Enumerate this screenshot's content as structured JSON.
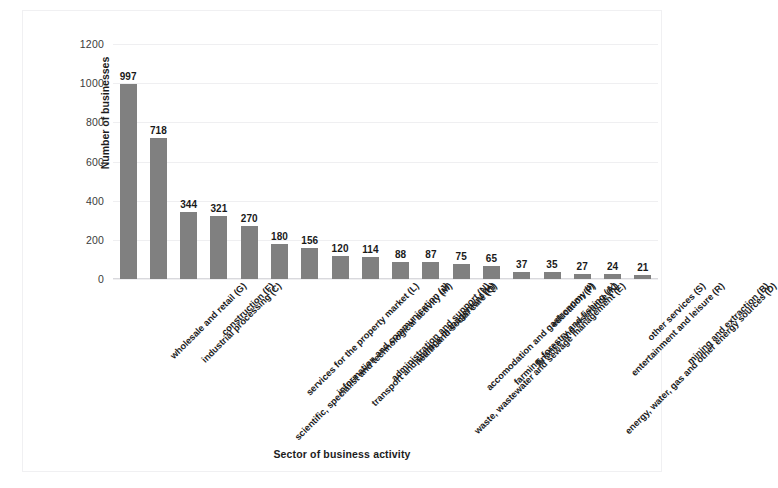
{
  "chart_data": {
    "type": "bar",
    "title": "",
    "xlabel": "Sector of business activity",
    "ylabel": "Number of businesses",
    "ylim": [
      0,
      1200
    ],
    "yticks": [
      0,
      200,
      400,
      600,
      800,
      1000,
      1200
    ],
    "grid": true,
    "legend": false,
    "bar_color": "#808080",
    "categories": [
      "wholesale and retail (G)",
      "industrial processing (C)",
      "construction (F)",
      "scientific, specialist and technological activity (M)",
      "services for the property market (L)",
      "information and communication (J)",
      "transport and storage management (H)",
      "administration and support (N)",
      "health and social care (Q)",
      "waste, wastewater and sewage management (E)",
      "accomodation and gastronomy (I)",
      "farming, forestry and fishing (A)",
      "finance and insurance (K)",
      "education (P)",
      "energy, water, gas and other energy sources (D)",
      "entertainment and leisure (R)",
      "other services (S)",
      "mining and extraction (B)"
    ],
    "values": [
      997,
      718,
      344,
      321,
      270,
      180,
      156,
      120,
      114,
      88,
      87,
      75,
      65,
      37,
      35,
      27,
      24,
      21
    ]
  }
}
